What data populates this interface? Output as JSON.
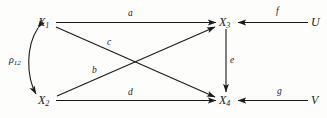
{
  "diagram": {
    "type": "path-diagram",
    "title": "",
    "background_color": "#fdfdfc",
    "line_color": "#1a1a1a",
    "nodes": [
      {
        "id": "X1",
        "base": "X",
        "sub": "1",
        "x": 45,
        "y": 22
      },
      {
        "id": "X2",
        "base": "X",
        "sub": "2",
        "x": 45,
        "y": 100
      },
      {
        "id": "X3",
        "base": "X",
        "sub": "3",
        "x": 226,
        "y": 22
      },
      {
        "id": "X4",
        "base": "X",
        "sub": "4",
        "x": 226,
        "y": 100
      },
      {
        "id": "U",
        "base": "U",
        "sub": "",
        "x": 313,
        "y": 22
      },
      {
        "id": "V",
        "base": "V",
        "sub": "",
        "x": 313,
        "y": 100
      }
    ],
    "edges": [
      {
        "id": "a",
        "label": "a",
        "from": "X1",
        "to": "X3",
        "kind": "straight-arrow",
        "label_x": 128,
        "label_y": 11
      },
      {
        "id": "c",
        "label": "c",
        "from": "X1",
        "to": "X4",
        "kind": "straight-arrow",
        "label_x": 107,
        "label_y": 40
      },
      {
        "id": "b",
        "label": "b",
        "from": "X2",
        "to": "X3",
        "kind": "straight-arrow",
        "label_x": 92,
        "label_y": 68
      },
      {
        "id": "d",
        "label": "d",
        "from": "X2",
        "to": "X4",
        "kind": "straight-arrow",
        "label_x": 128,
        "label_y": 90
      },
      {
        "id": "e",
        "label": "e",
        "from": "X3",
        "to": "X4",
        "kind": "straight-arrow",
        "label_x": 230,
        "label_y": 58
      },
      {
        "id": "f",
        "label": "f",
        "from": "U",
        "to": "X3",
        "kind": "straight-arrow",
        "label_x": 276,
        "label_y": 9
      },
      {
        "id": "g",
        "label": "g",
        "from": "V",
        "to": "X4",
        "kind": "straight-arrow",
        "label_x": 277,
        "label_y": 89
      },
      {
        "id": "rho12",
        "label": "ρ",
        "sub": "12",
        "from": "X1",
        "to": "X2",
        "kind": "curved-double-arrow",
        "label_x": 9,
        "label_y": 56
      }
    ]
  }
}
